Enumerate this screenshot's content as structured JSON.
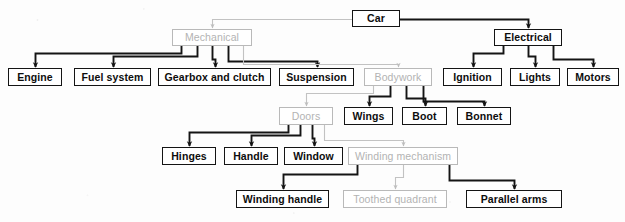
{
  "figure": {
    "kind": "hierarchy-tree-diagram",
    "subject": "Car",
    "width": 625,
    "height": 222,
    "background_color": "#fdfdfd",
    "ink_color": "#141414",
    "faded_ink_color": "#b9b9b9",
    "faded_text_color": "#b3b3b3"
  },
  "nodes": [
    {
      "id": "car",
      "label": "Car",
      "level": 0,
      "faded": false,
      "x": 352,
      "y": 10,
      "w": 48,
      "h": 17
    },
    {
      "id": "mechanical",
      "label": "Mechanical",
      "level": 1,
      "faded": true,
      "x": 172,
      "y": 29,
      "w": 80,
      "h": 17
    },
    {
      "id": "electrical",
      "label": "Electrical",
      "level": 1,
      "faded": false,
      "x": 494,
      "y": 29,
      "w": 68,
      "h": 17
    },
    {
      "id": "engine",
      "label": "Engine",
      "level": 2,
      "faded": false,
      "x": 8,
      "y": 68,
      "w": 54,
      "h": 18
    },
    {
      "id": "fuel-system",
      "label": "Fuel system",
      "level": 2,
      "faded": false,
      "x": 74,
      "y": 68,
      "w": 77,
      "h": 18
    },
    {
      "id": "gearbox-clutch",
      "label": "Gearbox and clutch",
      "level": 2,
      "faded": false,
      "x": 158,
      "y": 68,
      "w": 113,
      "h": 18
    },
    {
      "id": "suspension",
      "label": "Suspension",
      "level": 2,
      "faded": false,
      "x": 279,
      "y": 68,
      "w": 75,
      "h": 18
    },
    {
      "id": "bodywork",
      "label": "Bodywork",
      "level": 2,
      "faded": true,
      "x": 364,
      "y": 68,
      "w": 68,
      "h": 18
    },
    {
      "id": "ignition",
      "label": "Ignition",
      "level": 2,
      "faded": false,
      "x": 443,
      "y": 68,
      "w": 59,
      "h": 18
    },
    {
      "id": "lights",
      "label": "Lights",
      "level": 2,
      "faded": false,
      "x": 510,
      "y": 68,
      "w": 50,
      "h": 18
    },
    {
      "id": "motors",
      "label": "Motors",
      "level": 2,
      "faded": false,
      "x": 567,
      "y": 68,
      "w": 52,
      "h": 18
    },
    {
      "id": "doors",
      "label": "Doors",
      "level": 3,
      "faded": true,
      "x": 279,
      "y": 107,
      "w": 54,
      "h": 18
    },
    {
      "id": "wings",
      "label": "Wings",
      "level": 3,
      "faded": false,
      "x": 344,
      "y": 107,
      "w": 49,
      "h": 18
    },
    {
      "id": "boot",
      "label": "Boot",
      "level": 3,
      "faded": false,
      "x": 402,
      "y": 107,
      "w": 45,
      "h": 18
    },
    {
      "id": "bonnet",
      "label": "Bonnet",
      "level": 3,
      "faded": false,
      "x": 457,
      "y": 107,
      "w": 54,
      "h": 18
    },
    {
      "id": "hinges",
      "label": "Hinges",
      "level": 4,
      "faded": false,
      "x": 162,
      "y": 147,
      "w": 54,
      "h": 18
    },
    {
      "id": "handle",
      "label": "Handle",
      "level": 4,
      "faded": false,
      "x": 224,
      "y": 147,
      "w": 54,
      "h": 18
    },
    {
      "id": "window",
      "label": "Window",
      "level": 4,
      "faded": false,
      "x": 284,
      "y": 147,
      "w": 59,
      "h": 18
    },
    {
      "id": "winding-mechanism",
      "label": "Winding mechanism",
      "level": 4,
      "faded": true,
      "x": 348,
      "y": 147,
      "w": 110,
      "h": 18
    },
    {
      "id": "winding-handle",
      "label": "Winding handle",
      "level": 5,
      "faded": false,
      "x": 236,
      "y": 190,
      "w": 93,
      "h": 18
    },
    {
      "id": "toothed-quadrant",
      "label": "Toothed quadrant",
      "level": 5,
      "faded": true,
      "x": 343,
      "y": 190,
      "w": 104,
      "h": 18
    },
    {
      "id": "parallel-arms",
      "label": "Parallel arms",
      "level": 5,
      "faded": false,
      "x": 466,
      "y": 190,
      "w": 96,
      "h": 18
    }
  ],
  "edges": [
    {
      "from": "car",
      "to": "mechanical",
      "faded": true
    },
    {
      "from": "car",
      "to": "electrical",
      "faded": false
    },
    {
      "from": "mechanical",
      "to": "engine",
      "faded": false
    },
    {
      "from": "mechanical",
      "to": "fuel-system",
      "faded": false
    },
    {
      "from": "mechanical",
      "to": "gearbox-clutch",
      "faded": false
    },
    {
      "from": "mechanical",
      "to": "suspension",
      "faded": false
    },
    {
      "from": "mechanical",
      "to": "bodywork",
      "faded": true
    },
    {
      "from": "electrical",
      "to": "ignition",
      "faded": false
    },
    {
      "from": "electrical",
      "to": "lights",
      "faded": false
    },
    {
      "from": "electrical",
      "to": "motors",
      "faded": false
    },
    {
      "from": "bodywork",
      "to": "doors",
      "faded": true
    },
    {
      "from": "bodywork",
      "to": "wings",
      "faded": false
    },
    {
      "from": "bodywork",
      "to": "boot",
      "faded": false
    },
    {
      "from": "bodywork",
      "to": "bonnet",
      "faded": false
    },
    {
      "from": "doors",
      "to": "hinges",
      "faded": false
    },
    {
      "from": "doors",
      "to": "handle",
      "faded": false
    },
    {
      "from": "doors",
      "to": "window",
      "faded": false
    },
    {
      "from": "doors",
      "to": "winding-mechanism",
      "faded": true
    },
    {
      "from": "winding-mechanism",
      "to": "winding-handle",
      "faded": false
    },
    {
      "from": "winding-mechanism",
      "to": "toothed-quadrant",
      "faded": true
    },
    {
      "from": "winding-mechanism",
      "to": "parallel-arms",
      "faded": false
    }
  ]
}
